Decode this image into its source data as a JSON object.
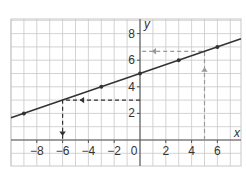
{
  "chart_data": {
    "type": "line",
    "title": "",
    "xlabel": "x",
    "ylabel": "y",
    "xlim": [
      -9.8,
      7.8
    ],
    "ylim": [
      -2,
      9.1
    ],
    "grid": true,
    "x_ticks": [
      -8,
      -6,
      -4,
      -2,
      0,
      2,
      4,
      6
    ],
    "x_tick_labels": [
      "−8",
      "−6",
      "−4",
      "−2",
      "0",
      "2",
      "4",
      "6"
    ],
    "y_ticks": [
      2,
      4,
      6,
      8
    ],
    "y_tick_labels": [
      "2",
      "4",
      "6",
      "8"
    ],
    "series": [
      {
        "name": "line",
        "equation": "y = x/3 + 5",
        "slope": 0.3333,
        "intercept": 5,
        "color": "#333333",
        "points": [
          {
            "x": -9,
            "y": 2
          },
          {
            "x": -3,
            "y": 4
          },
          {
            "x": 0,
            "y": 5
          },
          {
            "x": 3,
            "y": 6
          },
          {
            "x": 6,
            "y": 7
          }
        ]
      }
    ],
    "annotations": [
      {
        "name": "read-x-from-y",
        "style": "dashed",
        "color": "#333333",
        "path": [
          {
            "x": 0,
            "y": 3
          },
          {
            "x": -6,
            "y": 3
          },
          {
            "x": -6,
            "y": 0
          }
        ],
        "description": "From y=3 across to the line, then down to x=-6"
      },
      {
        "name": "read-y-from-x",
        "style": "dashed",
        "color": "#999999",
        "path": [
          {
            "x": 5,
            "y": 0
          },
          {
            "x": 5,
            "y": 6.67
          },
          {
            "x": 0,
            "y": 6.67
          }
        ],
        "description": "From x=5 up to the line, then across to y≈6.7"
      }
    ]
  },
  "colors": {
    "grid": "#c8c8c8",
    "axis": "#555555",
    "line": "#333333",
    "dark_dash": "#333333",
    "gray_dash": "#9a9a9a"
  }
}
